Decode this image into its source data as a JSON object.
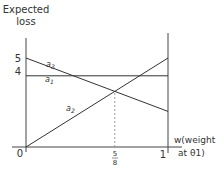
{
  "chart_data": {
    "type": "line",
    "title": "",
    "xlabel": "w(weight at θ1)",
    "xlabel_lines": [
      "w(weight",
      "at θ1)"
    ],
    "ylabel": "Expected loss",
    "ylabel_lines": [
      "Expected",
      "loss"
    ],
    "xlim": [
      0,
      1
    ],
    "ylim": [
      0,
      5
    ],
    "grid": false,
    "legend": "inline labels",
    "y_ticks": [
      "5",
      "4"
    ],
    "x_ticks": [
      "0",
      "5/8",
      "1"
    ],
    "x_tick_fraction": {
      "num": "5",
      "den": "8"
    },
    "series": [
      {
        "name": "a1",
        "label_base": "a",
        "label_sub": "1",
        "x": [
          0,
          1
        ],
        "values": [
          4,
          4
        ]
      },
      {
        "name": "a2",
        "label_base": "a",
        "label_sub": "2",
        "x": [
          0,
          1
        ],
        "values": [
          0,
          5
        ]
      },
      {
        "name": "a3",
        "label_base": "a",
        "label_sub": "3",
        "x": [
          0,
          1
        ],
        "values": [
          5,
          2
        ]
      }
    ],
    "annotations": [
      {
        "type": "dashed-vertical",
        "x": 0.625,
        "from": 0,
        "to": 3.125,
        "note": "intersection of a2 and a3 at w = 5/8"
      }
    ]
  }
}
